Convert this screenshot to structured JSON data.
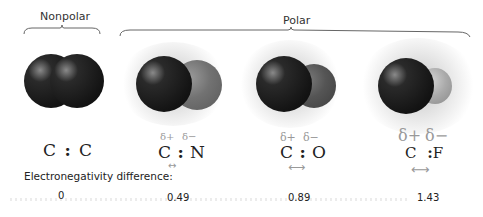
{
  "groups": {
    "nonpolar": {
      "label": "Nonpolar"
    },
    "polar": {
      "label": "Polar"
    }
  },
  "molecules": [
    {
      "formula_left": "C",
      "bond": ":",
      "formula_right": "C",
      "delta_plus": "",
      "delta_minus": "",
      "arrow": "",
      "en_difference": "0",
      "color_left": "#1e1e1e",
      "color_right": "#1e1e1e"
    },
    {
      "formula_left": "C",
      "bond": ":",
      "formula_right": "N",
      "delta_plus": "δ+",
      "delta_minus": "δ−",
      "arrow": "↔",
      "en_difference": "0.49",
      "color_left": "#1e1e1e",
      "color_right": "#6f6f6f"
    },
    {
      "formula_left": "C",
      "bond": ":",
      "formula_right": "O",
      "delta_plus": "δ+",
      "delta_minus": "δ−",
      "arrow": "⟷",
      "en_difference": "0.89",
      "color_left": "#1e1e1e",
      "color_right": "#555555"
    },
    {
      "formula_left": "C",
      "bond": ":",
      "formula_right": "F",
      "delta_plus": "δ+",
      "delta_minus": "δ−",
      "arrow": "⟷",
      "en_difference": "1.43",
      "color_left": "#1e1e1e",
      "color_right": "#a8a8a8"
    }
  ],
  "electronegativity": {
    "label": "Electronegativity difference:"
  }
}
